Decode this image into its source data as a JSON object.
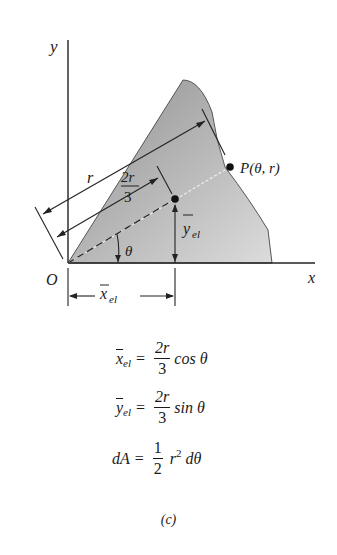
{
  "figure": {
    "axes": {
      "x_label": "x",
      "y_label": "y",
      "origin_label": "O"
    },
    "point_label": "P(θ, r)",
    "radius_label": "r",
    "two_thirds_r_num": "2r",
    "two_thirds_r_den": "3",
    "angle_label": "θ",
    "y_el_label": "y",
    "y_el_sub": "el",
    "x_el_label": "x",
    "x_el_sub": "el",
    "fill_color": "#a9a9a9",
    "fill_light": "#d6d6d6"
  },
  "equations": [
    {
      "lhs": "x",
      "lhs_sub": "el",
      "num": "2r",
      "den": "3",
      "rhs": "cos θ"
    },
    {
      "lhs": "y",
      "lhs_sub": "el",
      "num": "2r",
      "den": "3",
      "rhs": "sin θ"
    },
    {
      "lhs": "dA",
      "num": "1",
      "den": "2",
      "rhs_r": "r",
      "rhs_sup": "2",
      "rhs": "dθ"
    }
  ],
  "caption": "(c)"
}
